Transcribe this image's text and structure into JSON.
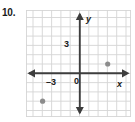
{
  "problem": {
    "number": "10."
  },
  "graph": {
    "axis_color": "#3d3d3d",
    "grid_color": "#d5d5d5",
    "point_color": "#8c8c8c",
    "background": "#ffffff",
    "x_axis_name": "x",
    "y_axis_name": "y",
    "origin_label": "0",
    "x_tick_label": "–3",
    "y_tick_label": "3"
  },
  "chart_data": {
    "type": "scatter",
    "title": "",
    "xlabel": "x",
    "ylabel": "y",
    "xlim": [
      -5.8,
      5.5
    ],
    "ylim": [
      -4.8,
      6.0
    ],
    "grid": true,
    "grid_step": 1,
    "legend": "none",
    "x_ticks_labeled": [
      -3
    ],
    "y_ticks_labeled": [
      3
    ],
    "origin_label": "0",
    "points": [
      {
        "x": -4,
        "y": -3
      },
      {
        "x": 3,
        "y": 1
      }
    ]
  }
}
